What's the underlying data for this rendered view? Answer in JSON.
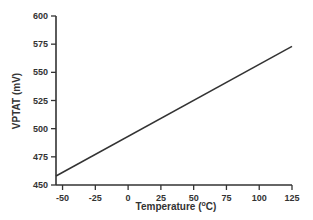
{
  "chart_data": {
    "type": "line",
    "title": "",
    "xlabel": "Temperature (°C)",
    "xlabel_parts": {
      "pre": "Temperature (",
      "sup": "o",
      "post": "C)"
    },
    "ylabel": "VPTAT (mV)",
    "xlim": [
      -55,
      125
    ],
    "ylim": [
      450,
      600
    ],
    "xticks": [
      -50,
      -25,
      0,
      25,
      50,
      75,
      100,
      125
    ],
    "yticks": [
      450,
      475,
      500,
      525,
      550,
      575,
      600
    ],
    "grid": false,
    "legend": null,
    "series": [
      {
        "name": "VPTAT",
        "color": "#333333",
        "x": [
          -55,
          125
        ],
        "y": [
          458,
          573
        ]
      }
    ]
  }
}
